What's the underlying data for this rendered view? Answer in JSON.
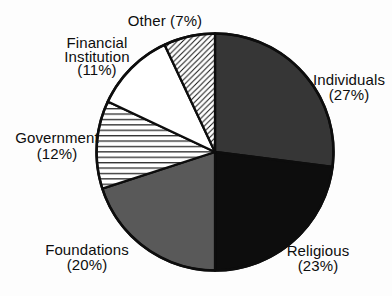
{
  "figure": {
    "ink": "#0d0d0d",
    "paper": "#ffffff"
  },
  "chart_data": {
    "type": "pie",
    "title": "",
    "start_angle_deg": 0,
    "direction": "clockwise",
    "legend": "none (direct slice labels)",
    "ink": "#0d0d0d",
    "paper": "#ffffff",
    "categories": [
      "Individuals",
      "Religious",
      "Foundations",
      "Government",
      "Financial Institution",
      "Other"
    ],
    "values": [
      27,
      23,
      20,
      12,
      11,
      7
    ],
    "slices": [
      {
        "id": "individuals",
        "label": "Individuals",
        "pct": 27,
        "pct_label": "(27%)",
        "fill": "#363636",
        "pattern": "solid",
        "label_lines": [
          "Individuals",
          "(27%)"
        ]
      },
      {
        "id": "religious",
        "label": "Religious",
        "pct": 23,
        "pct_label": "(23%)",
        "fill": "#0d0d0d",
        "pattern": "solid",
        "label_lines": [
          "Religious",
          "(23%)"
        ]
      },
      {
        "id": "foundations",
        "label": "Foundations",
        "pct": 20,
        "pct_label": "(20%)",
        "fill": "#595959",
        "pattern": "solid",
        "label_lines": [
          "Foundations",
          "(20%)"
        ]
      },
      {
        "id": "government",
        "label": "Government",
        "pct": 12,
        "pct_label": "(12%)",
        "fill": "#ffffff",
        "pattern": "hlines",
        "label_lines": [
          "Government",
          "(12%)"
        ]
      },
      {
        "id": "financial-institution",
        "label": "Financial Institution",
        "pct": 11,
        "pct_label": "(11%)",
        "fill": "#ffffff",
        "pattern": "solid",
        "label_lines": [
          "Financial",
          "Institution",
          "(11%)"
        ]
      },
      {
        "id": "other",
        "label": "Other",
        "pct": 7,
        "pct_label": "(7%)",
        "fill": "#ffffff",
        "pattern": "diag",
        "label_lines": [
          "Other (7%)"
        ]
      }
    ]
  }
}
